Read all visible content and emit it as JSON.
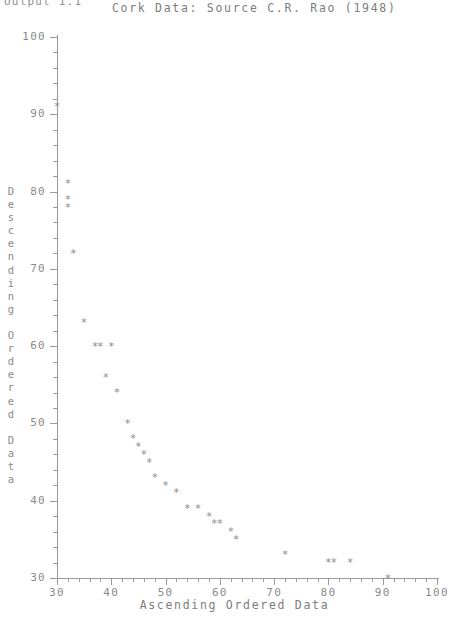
{
  "output_label": "Output 1.1",
  "axis": {
    "y_title_chars": [
      "D",
      "e",
      "s",
      "c",
      "e",
      "n",
      "d",
      "i",
      "n",
      "g",
      " ",
      "O",
      "r",
      "d",
      "e",
      "r",
      "e",
      "d",
      " ",
      "D",
      "a",
      "t",
      "a"
    ],
    "y_title": "Descending Ordered Data",
    "x_title": "Ascending Ordered Data",
    "y_ticklabels": [
      "100",
      "90",
      "80",
      "70",
      "60",
      "50",
      "40",
      "30"
    ],
    "x_ticklabels": [
      "30",
      "40",
      "50",
      "60",
      "70",
      "80",
      "90",
      "100"
    ]
  },
  "colors": {
    "axis": "#9a9a9a",
    "text": "#8a8a8a",
    "marker": "#8c8c8c",
    "background": "#ffffff"
  },
  "marker_glyph": "*",
  "chart_data": {
    "type": "scatter",
    "title": "Cork Data: Source C.R. Rao (1948)",
    "subtitle": "",
    "xlabel": "Ascending Ordered Data",
    "ylabel": "Descending Ordered Data",
    "xlim": [
      30,
      100
    ],
    "ylim": [
      30,
      100
    ],
    "xticks": [
      30,
      40,
      50,
      60,
      70,
      80,
      90,
      100
    ],
    "yticks": [
      30,
      40,
      50,
      60,
      70,
      80,
      90,
      100
    ],
    "xminor_step": 2,
    "yminor_step": 2,
    "grid": false,
    "legend": false,
    "marker": "*",
    "series": [
      {
        "name": "Cork boring data",
        "x": [
          30,
          32,
          32,
          32,
          33,
          35,
          37,
          38,
          40,
          39,
          41,
          43,
          44,
          45,
          46,
          47,
          48,
          50,
          52,
          54,
          56,
          58,
          59,
          60,
          62,
          63,
          72,
          80,
          81,
          84,
          91
        ],
        "y": [
          91,
          81,
          79,
          78,
          72,
          63,
          60,
          60,
          60,
          56,
          54,
          50,
          48,
          47,
          46,
          45,
          43,
          42,
          41,
          39,
          39,
          38,
          37,
          37,
          36,
          35,
          33,
          32,
          32,
          32,
          30
        ]
      }
    ],
    "points": [
      {
        "x": 30,
        "y": 91
      },
      {
        "x": 32,
        "y": 81
      },
      {
        "x": 32,
        "y": 79
      },
      {
        "x": 32,
        "y": 78
      },
      {
        "x": 33,
        "y": 72
      },
      {
        "x": 35,
        "y": 63
      },
      {
        "x": 37,
        "y": 60
      },
      {
        "x": 38,
        "y": 60
      },
      {
        "x": 40,
        "y": 60
      },
      {
        "x": 39,
        "y": 56
      },
      {
        "x": 41,
        "y": 54
      },
      {
        "x": 43,
        "y": 50
      },
      {
        "x": 44,
        "y": 48
      },
      {
        "x": 45,
        "y": 47
      },
      {
        "x": 46,
        "y": 46
      },
      {
        "x": 47,
        "y": 45
      },
      {
        "x": 48,
        "y": 43
      },
      {
        "x": 50,
        "y": 42
      },
      {
        "x": 52,
        "y": 41
      },
      {
        "x": 54,
        "y": 39
      },
      {
        "x": 56,
        "y": 39
      },
      {
        "x": 58,
        "y": 38
      },
      {
        "x": 59,
        "y": 37
      },
      {
        "x": 60,
        "y": 37
      },
      {
        "x": 62,
        "y": 36
      },
      {
        "x": 63,
        "y": 35
      },
      {
        "x": 72,
        "y": 33
      },
      {
        "x": 80,
        "y": 32
      },
      {
        "x": 81,
        "y": 32
      },
      {
        "x": 84,
        "y": 32
      },
      {
        "x": 91,
        "y": 30
      }
    ]
  }
}
